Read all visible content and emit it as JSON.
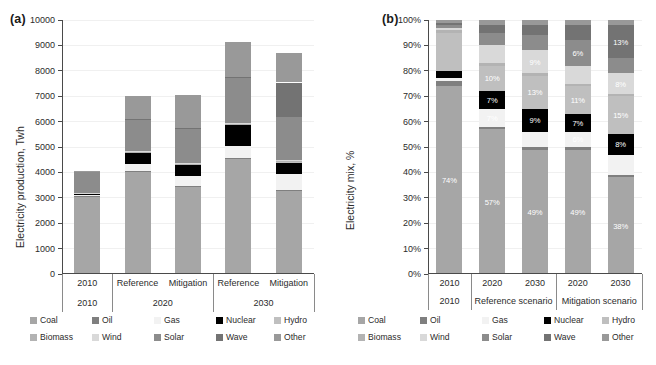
{
  "figure": {
    "panels": [
      {
        "tag": "(a)",
        "ylabel": "Electricity production, Twh"
      },
      {
        "tag": "(b)",
        "ylabel": "Electricity mix, %"
      }
    ]
  },
  "legend": {
    "entries": [
      {
        "label": "Coal",
        "color": "#a6a6a6"
      },
      {
        "label": "Oil",
        "color": "#7f7f7f"
      },
      {
        "label": "Gas",
        "color": "#f2f2f2"
      },
      {
        "label": "Nuclear",
        "color": "#000000"
      },
      {
        "label": "Hydro",
        "color": "#bfbfbf"
      },
      {
        "label": "Biomass",
        "color": "#b3b3b3"
      },
      {
        "label": "Wind",
        "color": "#d9d9d9"
      },
      {
        "label": "Solar",
        "color": "#8c8c8c"
      },
      {
        "label": "Wave",
        "color": "#737373"
      },
      {
        "label": "Other",
        "color": "#999999"
      }
    ]
  },
  "chart_data": [
    {
      "type": "bar",
      "panel": "a",
      "stacked": true,
      "title": "",
      "xlabel": "",
      "ylabel": "Electricity production, Twh",
      "ylim": [
        0,
        10000
      ],
      "yticks": [
        0,
        1000,
        2000,
        3000,
        4000,
        5000,
        6000,
        7000,
        8000,
        9000,
        10000
      ],
      "ytick_labels": [
        "0",
        "1000",
        "2000",
        "3000",
        "4000",
        "5000",
        "6000",
        "7000",
        "8000",
        "9000",
        "10000"
      ],
      "grid": true,
      "legend_position": "below",
      "categories": [
        "2010",
        "Reference",
        "Mitigation",
        "Reference",
        "Mitigation"
      ],
      "group_labels": [
        "2010",
        "2020",
        "2030"
      ],
      "group_spans": [
        1,
        2,
        2
      ],
      "series": [
        {
          "name": "Coal",
          "color": "#a6a6a6",
          "values": [
            3060,
            4040,
            3440,
            4560,
            3270
          ]
        },
        {
          "name": "Oil",
          "color": "#7f7f7f",
          "values": [
            20,
            20,
            20,
            20,
            20
          ]
        },
        {
          "name": "Gas",
          "color": "#f2f2f2",
          "values": [
            15,
            270,
            400,
            460,
            660
          ]
        },
        {
          "name": "Nuclear",
          "color": "#000000",
          "values": [
            60,
            420,
            420,
            810,
            440
          ]
        },
        {
          "name": "Hydro",
          "color": "#bfbfbf",
          "values": [
            30,
            50,
            40,
            50,
            50
          ]
        },
        {
          "name": "Biomass",
          "color": "#b3b3b3",
          "values": [
            10,
            20,
            20,
            20,
            20
          ]
        },
        {
          "name": "Wind",
          "color": "#d9d9d9",
          "values": [
            10,
            20,
            20,
            20,
            20
          ]
        },
        {
          "name": "Solar",
          "color": "#8c8c8c",
          "values": [
            830,
            1240,
            1370,
            1810,
            1700
          ]
        },
        {
          "name": "Wave",
          "color": "#737373",
          "values": [
            10,
            20,
            20,
            20,
            1360
          ]
        },
        {
          "name": "Other",
          "color": "#999999",
          "values": [
            10,
            910,
            1280,
            1350,
            1160
          ]
        }
      ],
      "totals": [
        4055,
        7010,
        7030,
        9120,
        8700
      ]
    },
    {
      "type": "bar",
      "panel": "b",
      "stacked": true,
      "title": "",
      "xlabel": "",
      "ylabel": "Electricity mix, %",
      "ylim": [
        0,
        100
      ],
      "yticks": [
        0,
        10,
        20,
        30,
        40,
        50,
        60,
        70,
        80,
        90,
        100
      ],
      "ytick_labels": [
        "0%",
        "10%",
        "20%",
        "30%",
        "40%",
        "50%",
        "60%",
        "70%",
        "80%",
        "90%",
        "100%"
      ],
      "grid": true,
      "legend_position": "below",
      "categories": [
        "2010",
        "2020",
        "2030",
        "2020",
        "2030"
      ],
      "group_labels": [
        "2010",
        "Reference scenario",
        "Mitigation scenario"
      ],
      "group_spans": [
        1,
        2,
        2
      ],
      "series": [
        {
          "name": "Coal",
          "color": "#a6a6a6",
          "values": [
            74,
            57,
            49,
            49,
            38
          ]
        },
        {
          "name": "Oil",
          "color": "#7f7f7f",
          "values": [
            2,
            1,
            1,
            1,
            1
          ]
        },
        {
          "name": "Gas",
          "color": "#f2f2f2",
          "values": [
            1,
            7,
            6,
            6,
            8
          ]
        },
        {
          "name": "Nuclear",
          "color": "#000000",
          "values": [
            3,
            7,
            9,
            7,
            8
          ]
        },
        {
          "name": "Hydro",
          "color": "#bfbfbf",
          "values": [
            15,
            10,
            13,
            11,
            15
          ]
        },
        {
          "name": "Biomass",
          "color": "#b3b3b3",
          "values": [
            1,
            1,
            1,
            1,
            1
          ]
        },
        {
          "name": "Wind",
          "color": "#d9d9d9",
          "values": [
            1,
            7,
            9,
            7,
            8
          ]
        },
        {
          "name": "Solar",
          "color": "#8c8c8c",
          "values": [
            1,
            5,
            6,
            10,
            6
          ]
        },
        {
          "name": "Wave",
          "color": "#737373",
          "values": [
            1,
            3,
            4,
            6,
            13
          ]
        },
        {
          "name": "Other",
          "color": "#999999",
          "values": [
            1,
            2,
            2,
            2,
            2
          ]
        }
      ],
      "data_labels": [
        {
          "bar": 0,
          "series": "Coal",
          "text": "74%"
        },
        {
          "bar": 1,
          "series": "Coal",
          "text": "57%"
        },
        {
          "bar": 1,
          "series": "Gas",
          "text": "7%"
        },
        {
          "bar": 1,
          "series": "Nuclear",
          "text": "7%"
        },
        {
          "bar": 1,
          "series": "Hydro",
          "text": "10%"
        },
        {
          "bar": 2,
          "series": "Coal",
          "text": "49%"
        },
        {
          "bar": 2,
          "series": "Nuclear",
          "text": "9%"
        },
        {
          "bar": 2,
          "series": "Wind",
          "text": "9%"
        },
        {
          "bar": 2,
          "series": "Hydro",
          "text": "13%"
        },
        {
          "bar": 3,
          "series": "Coal",
          "text": "49%"
        },
        {
          "bar": 3,
          "series": "Gas",
          "text": "6%"
        },
        {
          "bar": 3,
          "series": "Nuclear",
          "text": "7%"
        },
        {
          "bar": 3,
          "series": "Hydro",
          "text": "11%"
        },
        {
          "bar": 3,
          "series": "Solar",
          "text": "6%"
        },
        {
          "bar": 4,
          "series": "Coal",
          "text": "38%"
        },
        {
          "bar": 4,
          "series": "Nuclear",
          "text": "8%"
        },
        {
          "bar": 4,
          "series": "Wind",
          "text": "8%"
        },
        {
          "bar": 4,
          "series": "Hydro",
          "text": "15%"
        },
        {
          "bar": 4,
          "series": "Wave",
          "text": "13%"
        }
      ]
    }
  ]
}
